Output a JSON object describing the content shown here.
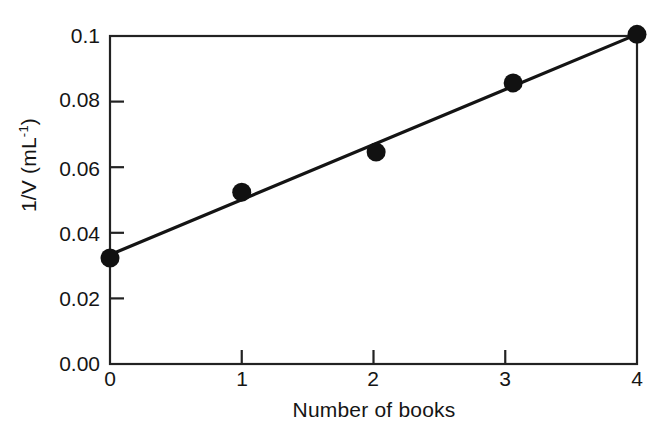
{
  "chart_data": {
    "type": "scatter",
    "title": "",
    "xlabel": "Number of books",
    "ylabel": "1/V (mL⁻¹)",
    "ylabel_base": "1/V (mL",
    "ylabel_sup": "-1",
    "ylabel_close": ")",
    "xlim": [
      0,
      4
    ],
    "ylim": [
      0.0,
      0.1
    ],
    "grid": false,
    "legend": null,
    "x_ticks": [
      "0",
      "1",
      "2",
      "3",
      "4"
    ],
    "x_tick_values": [
      0,
      1,
      2,
      3,
      4
    ],
    "y_ticks": [
      "0.00",
      "0.02",
      "0.04",
      "0.06",
      "0.08",
      "0.1"
    ],
    "y_tick_values": [
      0.0,
      0.02,
      0.04,
      0.06,
      0.08,
      0.1
    ],
    "points": [
      {
        "x": 0.0,
        "y": 0.0323
      },
      {
        "x": 1.0,
        "y": 0.0524
      },
      {
        "x": 2.02,
        "y": 0.0646
      },
      {
        "x": 3.06,
        "y": 0.0857
      },
      {
        "x": 4.0,
        "y": 0.1005
      }
    ],
    "series": [
      {
        "name": "measurements",
        "x": [
          0.0,
          1.0,
          2.02,
          3.06,
          4.0
        ],
        "values": [
          0.0323,
          0.0524,
          0.0646,
          0.0857,
          0.1005
        ],
        "marker": "filled-circle",
        "color": "#111111"
      },
      {
        "name": "best-fit-line",
        "x": [
          0.0,
          4.0
        ],
        "values": [
          0.0333,
          0.1005
        ],
        "marker": "none",
        "color": "#111111"
      }
    ],
    "fit_line": {
      "x_start": 0.0,
      "y_start": 0.0333,
      "x_end": 4.0,
      "y_end": 0.1005
    },
    "axis_color": "#222222",
    "marker_color": "#111111",
    "background": "#ffffff"
  }
}
